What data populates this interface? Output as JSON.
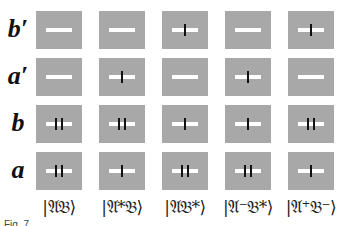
{
  "figure": {
    "rows": [
      {
        "label": "b′",
        "cells": [
          0,
          0,
          1,
          0,
          1
        ]
      },
      {
        "label": "a′",
        "cells": [
          0,
          1,
          0,
          1,
          0
        ]
      },
      {
        "label": "b",
        "cells": [
          2,
          2,
          1,
          1,
          2
        ]
      },
      {
        "label": "a",
        "cells": [
          2,
          1,
          2,
          2,
          1
        ]
      }
    ],
    "columns": [
      {
        "label": "|𝔄𝔅⟩"
      },
      {
        "label": "|𝔄*𝔅⟩"
      },
      {
        "label": "|𝔄𝔅*⟩"
      },
      {
        "label": "|𝔄⁻𝔅*⟩"
      },
      {
        "label": "|𝔄⁺𝔅⁻⟩"
      }
    ],
    "legend": {
      "cell_value_meaning": "number of black ticks on white bar (0 = none, 1 = single, 2 = double)"
    },
    "colors": {
      "box": "#a8a8a8",
      "bar": "#ffffff",
      "tick": "#111111"
    }
  },
  "caption": {
    "text": "Fig. 7  ..."
  }
}
